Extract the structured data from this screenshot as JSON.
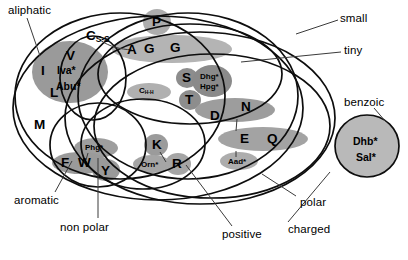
{
  "figure": {
    "type": "venn-diagram",
    "note": "Overlapping ellipse set diagram grouping amino acid one-letter codes and non-standard residue abbreviations by physico-chemical property."
  },
  "set_labels": [
    {
      "id": "aliphatic",
      "text": "aliphatic",
      "x": 8,
      "y": 6
    },
    {
      "id": "small",
      "text": "small",
      "x": 340,
      "y": 14
    },
    {
      "id": "tiny",
      "text": "tiny",
      "x": 344,
      "y": 47
    },
    {
      "id": "benzoic",
      "text": "benzoic",
      "x": 348,
      "y": 100
    },
    {
      "id": "aromatic",
      "text": "aromatic",
      "x": 16,
      "y": 196
    },
    {
      "id": "non-polar",
      "text": "non polar",
      "x": 62,
      "y": 222
    },
    {
      "id": "positive",
      "text": "positive",
      "x": 222,
      "y": 229
    },
    {
      "id": "polar",
      "text": "polar",
      "x": 300,
      "y": 198
    },
    {
      "id": "charged",
      "text": "charged",
      "x": 290,
      "y": 226
    }
  ],
  "residues": [
    {
      "id": "P",
      "text": "P",
      "size": "big",
      "x": 152,
      "y": 15
    },
    {
      "id": "A",
      "text": "A",
      "size": "big",
      "x": 128,
      "y": 44
    },
    {
      "id": "G1",
      "text": "G",
      "size": "big",
      "x": 146,
      "y": 42
    },
    {
      "id": "G2",
      "text": "G",
      "size": "big",
      "x": 172,
      "y": 41
    },
    {
      "id": "V",
      "text": "V",
      "size": "big",
      "x": 67,
      "y": 50
    },
    {
      "id": "Iva",
      "text": "Iva*",
      "size": "mid",
      "x": 59,
      "y": 66
    },
    {
      "id": "Abu",
      "text": "Abu*",
      "size": "mid",
      "x": 59,
      "y": 82
    },
    {
      "id": "I",
      "text": "I",
      "size": "big",
      "x": 42,
      "y": 65
    },
    {
      "id": "L",
      "text": "L",
      "size": "big",
      "x": 51,
      "y": 87
    },
    {
      "id": "M",
      "text": "M",
      "size": "big",
      "x": 36,
      "y": 119
    },
    {
      "id": "CSS",
      "text": "C",
      "sub": "S-S",
      "size": "big",
      "x": 88,
      "y": 30
    },
    {
      "id": "CHH",
      "text": "C",
      "sub": "H-H",
      "size": "sml",
      "x": 140,
      "y": 87
    },
    {
      "id": "S",
      "text": "S",
      "size": "big",
      "x": 182,
      "y": 72
    },
    {
      "id": "T",
      "text": "T",
      "size": "big",
      "x": 185,
      "y": 94
    },
    {
      "id": "Dhg",
      "text": "Dhg*",
      "size": "sml",
      "x": 200,
      "y": 70
    },
    {
      "id": "Hpg",
      "text": "Hpg*",
      "size": "sml",
      "x": 200,
      "y": 80
    },
    {
      "id": "D",
      "text": "D",
      "size": "big",
      "x": 212,
      "y": 110
    },
    {
      "id": "N",
      "text": "N",
      "size": "big",
      "x": 243,
      "y": 102
    },
    {
      "id": "E",
      "text": "E",
      "size": "big",
      "x": 241,
      "y": 133
    },
    {
      "id": "Q",
      "text": "Q",
      "size": "big",
      "x": 268,
      "y": 132
    },
    {
      "id": "Aad",
      "text": "Aad*",
      "size": "sml",
      "x": 228,
      "y": 157
    },
    {
      "id": "K",
      "text": "K",
      "size": "big",
      "x": 152,
      "y": 138
    },
    {
      "id": "Orn",
      "text": "Orn*",
      "size": "sml",
      "x": 141,
      "y": 160
    },
    {
      "id": "R",
      "text": "R",
      "size": "big",
      "x": 173,
      "y": 158
    },
    {
      "id": "Phg",
      "text": "Phg*",
      "size": "sml",
      "x": 87,
      "y": 143
    },
    {
      "id": "F",
      "text": "F",
      "size": "big",
      "x": 62,
      "y": 157
    },
    {
      "id": "W",
      "text": "W",
      "size": "big",
      "x": 81,
      "y": 157
    },
    {
      "id": "Y",
      "text": "Y",
      "size": "big",
      "x": 101,
      "y": 165
    },
    {
      "id": "Dhb",
      "text": "Dhb*",
      "size": "mid",
      "x": 357,
      "y": 137
    },
    {
      "id": "Sal",
      "text": "Sal*",
      "size": "mid",
      "x": 357,
      "y": 153
    }
  ],
  "colors": {
    "outline": "#111111",
    "blob_dark": "#8f8f8f",
    "blob_mid": "#a8a8a8",
    "blob_light": "#c9c9c9",
    "blob_pale": "#dcdcdc",
    "background": "#ffffff",
    "leader": "#555555"
  }
}
